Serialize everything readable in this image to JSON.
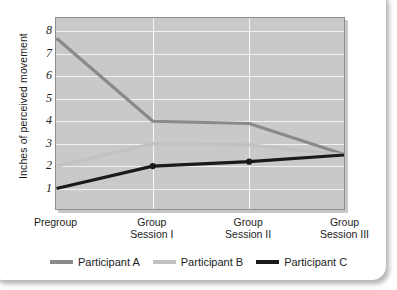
{
  "chart_data": {
    "type": "line",
    "title": "",
    "xlabel": "",
    "ylabel": "Inches of perceived movement",
    "categories": [
      "Pregroup",
      "Group Session I",
      "Group Session II",
      "Group Session III"
    ],
    "category_lines": [
      [
        "Pregroup",
        ""
      ],
      [
        "Group",
        "Session I"
      ],
      [
        "Group",
        "Session II"
      ],
      [
        "Group",
        "Session III"
      ]
    ],
    "yticks": [
      "1",
      "2",
      "3",
      "4",
      "5",
      "6",
      "7",
      "8"
    ],
    "ylim": [
      0,
      8.6
    ],
    "grid": "horizontal-and-vertical",
    "legend_position": "bottom",
    "series": [
      {
        "name": "Participant A",
        "color": "#8a8a8a",
        "values": [
          7.7,
          4.0,
          3.9,
          2.5
        ],
        "markers": false
      },
      {
        "name": "Participant B",
        "color": "#c2c2c2",
        "values": [
          2.0,
          3.0,
          2.95,
          2.5
        ],
        "markers": false
      },
      {
        "name": "Participant C",
        "color": "#1a1a1a",
        "values": [
          1.0,
          2.0,
          2.2,
          2.5
        ],
        "markers": true
      }
    ]
  },
  "legend": {
    "items": [
      {
        "label": "Participant A",
        "color": "#8a8a8a"
      },
      {
        "label": "Participant B",
        "color": "#c2c2c2"
      },
      {
        "label": "Participant C",
        "color": "#1a1a1a"
      }
    ]
  },
  "colors": {
    "participant_a": "#8a8a8a",
    "participant_b": "#c2c2c2",
    "participant_c": "#1a1a1a",
    "plot_background": "#c9c9c9",
    "gridline": "#f2f2f2",
    "card_background": "#ffffff"
  }
}
